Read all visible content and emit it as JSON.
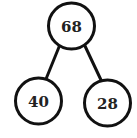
{
  "diagram": {
    "type": "number-bond",
    "whole": {
      "label": "68"
    },
    "parts": [
      {
        "label": "40"
      },
      {
        "label": "28"
      }
    ]
  }
}
